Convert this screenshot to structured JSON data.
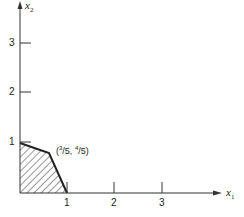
{
  "diagram": {
    "x_axis": {
      "label": "x",
      "subscript": "1",
      "ticks": [
        "1",
        "2",
        "3"
      ]
    },
    "y_axis": {
      "label": "x",
      "subscript": "2",
      "ticks": [
        "1",
        "2",
        "3"
      ]
    },
    "point_label": {
      "open": "(",
      "x_num": "3",
      "x_den": "/5",
      "sep": ", ",
      "y_num": "4",
      "y_den": "/5",
      "close": ")"
    },
    "region": {
      "vertices": [
        [
          0,
          0
        ],
        [
          0,
          1
        ],
        [
          0.6,
          0.8
        ],
        [
          1,
          0
        ]
      ],
      "fill": "hatched"
    },
    "colors": {
      "line": "#222222",
      "hatch": "#333333"
    }
  }
}
